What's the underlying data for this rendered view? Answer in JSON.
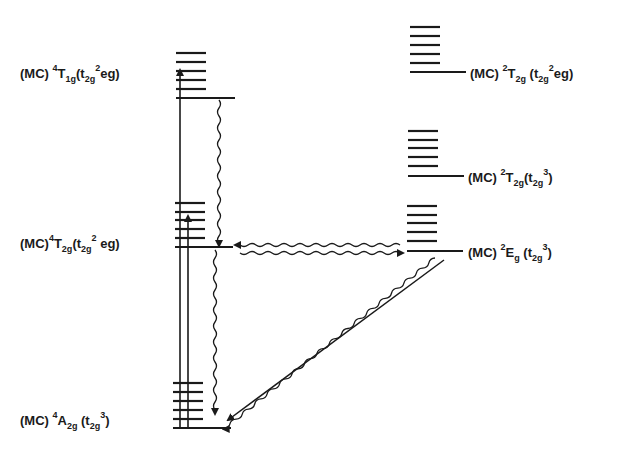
{
  "diagram": {
    "type": "energy-level-diagram (Jablonski-type)",
    "line_color": "#1a1a1a",
    "background": "#ffffff",
    "states": [
      {
        "id": "4T1g",
        "prefix": "(MC) ",
        "mult": "4",
        "term": "T",
        "term_sub": "1g",
        "config_open": "(t",
        "config_sub": "2g",
        "config_sup": "2",
        "config_tail": "eg)",
        "column": "left"
      },
      {
        "id": "4T2g",
        "prefix": "(MC)",
        "mult": "4",
        "term": "T",
        "term_sub": "2g",
        "config_open": "(t",
        "config_sub": "2g",
        "config_sup": "2",
        "config_tail": " eg)",
        "column": "left"
      },
      {
        "id": "4A2g",
        "prefix": "(MC) ",
        "mult": "4",
        "term": "A",
        "term_sub": "2g",
        "config_open": " (t",
        "config_sub": "2g",
        "config_sup": "3",
        "config_tail": ")",
        "column": "left"
      },
      {
        "id": "2T2g_upper",
        "prefix": "(MC) ",
        "mult": "2",
        "term": "T",
        "term_sub": "2g",
        "config_open": " (t",
        "config_sub": "2g",
        "config_sup": "2",
        "config_tail": "eg)",
        "column": "right"
      },
      {
        "id": "2T2g_lower",
        "prefix": "(MC) ",
        "mult": "2",
        "term": "T",
        "term_sub": "2g",
        "config_open": "(t",
        "config_sub": "2g",
        "config_sup": "3",
        "config_tail": ")",
        "column": "right"
      },
      {
        "id": "2Eg",
        "prefix": "(MC) ",
        "mult": "2",
        "term": "E",
        "term_sub": "g",
        "config_open": " (t",
        "config_sub": "2g",
        "config_sup": "3",
        "config_tail": ")",
        "column": "right"
      }
    ],
    "transitions": [
      {
        "from": "4A2g",
        "to": "4T1g",
        "kind": "absorption",
        "style": "straight"
      },
      {
        "from": "4A2g",
        "to": "4T2g",
        "kind": "absorption",
        "style": "straight"
      },
      {
        "from": "4T1g",
        "to": "4T2g",
        "kind": "nonradiative",
        "style": "wavy"
      },
      {
        "from": "4T2g",
        "to": "4A2g",
        "kind": "nonradiative",
        "style": "wavy"
      },
      {
        "from": "2Eg",
        "to": "4T2g",
        "kind": "back-intersystem-crossing",
        "style": "wavy"
      },
      {
        "from": "4T2g",
        "to": "2Eg",
        "kind": "intersystem-crossing",
        "style": "wavy"
      },
      {
        "from": "2Eg",
        "to": "4A2g",
        "kind": "nonradiative",
        "style": "wavy"
      },
      {
        "from": "2Eg",
        "to": "4A2g",
        "kind": "emission (phosphorescence)",
        "style": "straight"
      }
    ]
  }
}
